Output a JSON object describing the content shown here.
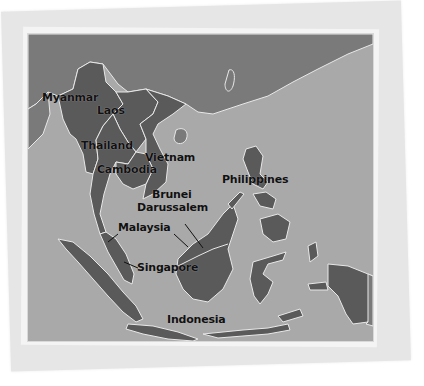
{
  "map": {
    "region": "Southeast Asia",
    "colors": {
      "sea": "#a9a9a9",
      "asean_land": "#5a5a5a",
      "other_land": "#7a7a7a",
      "border": "#e8e8e8",
      "label": "#111111",
      "paper": "#f4f4f4",
      "back_paper": "#e6e6e6"
    },
    "labels": [
      {
        "name": "Myanmar"
      },
      {
        "name": "Laos"
      },
      {
        "name": "Thailand"
      },
      {
        "name": "Vietnam"
      },
      {
        "name": "Cambodia"
      },
      {
        "name": "Brunei"
      },
      {
        "name": "Darussalem"
      },
      {
        "name": "Malaysia"
      },
      {
        "name": "Singapore"
      },
      {
        "name": "Philippines"
      },
      {
        "name": "Indonesia"
      }
    ]
  }
}
